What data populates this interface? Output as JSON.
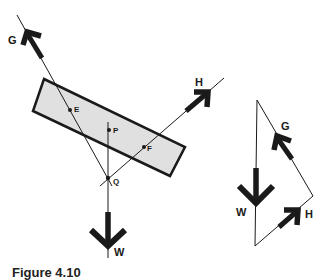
{
  "figure": {
    "caption": "Figure 4.10",
    "colors": {
      "ink": "#1a1a1a",
      "body_fill": "#e0e0e0",
      "background": "#ffffff"
    }
  },
  "left_diagram": {
    "body": {
      "shape": "tilted-rectangle",
      "corners": [
        [
          44,
          79
        ],
        [
          185,
          147
        ],
        [
          170,
          176
        ],
        [
          33,
          111
        ]
      ]
    },
    "points": [
      {
        "label": "E",
        "x": 70,
        "y": 110
      },
      {
        "label": "P",
        "x": 109,
        "y": 130
      },
      {
        "label": "F",
        "x": 144,
        "y": 147
      },
      {
        "label": "Q",
        "x": 108,
        "y": 178
      }
    ],
    "forces": [
      {
        "label": "G",
        "direction": "up-left"
      },
      {
        "label": "H",
        "direction": "up-right"
      },
      {
        "label": "W",
        "direction": "down"
      }
    ]
  },
  "right_diagram": {
    "type": "triangle-of-forces",
    "vertices": [
      [
        257,
        100
      ],
      [
        313,
        196
      ],
      [
        255,
        246
      ]
    ],
    "forces": [
      {
        "label": "G",
        "direction": "up-left"
      },
      {
        "label": "H",
        "direction": "up-right"
      },
      {
        "label": "W",
        "direction": "down"
      }
    ]
  }
}
